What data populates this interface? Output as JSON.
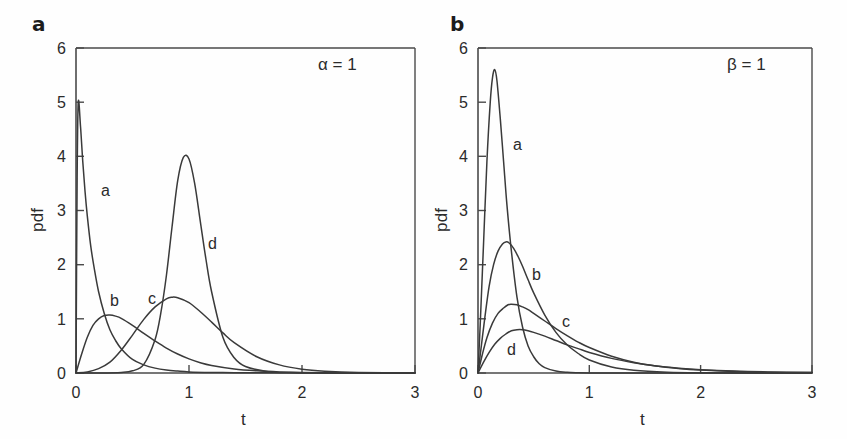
{
  "figure": {
    "background": "#ffffff",
    "line_color": "#3a3a3a",
    "axis_color": "#4a4a4a",
    "text_color": "#2b2b2b"
  },
  "panels": [
    {
      "id": "a",
      "label": "a",
      "annotation": "α = 1",
      "xlabel": "t",
      "ylabel": "pdf",
      "xticks": [
        "0",
        "1",
        "2",
        "3"
      ],
      "yticks": [
        "0",
        "1",
        "2",
        "3",
        "4",
        "5",
        "6"
      ],
      "curve_labels": [
        "a",
        "b",
        "c",
        "d"
      ]
    },
    {
      "id": "b",
      "label": "b",
      "annotation": "β = 1",
      "xlabel": "t",
      "ylabel": "pdf",
      "xticks": [
        "0",
        "1",
        "2",
        "3"
      ],
      "yticks": [
        "0",
        "1",
        "2",
        "3",
        "4",
        "5",
        "6"
      ],
      "curve_labels": [
        "a",
        "b",
        "c",
        "d"
      ]
    }
  ],
  "chart_data": [
    {
      "type": "line",
      "panel": "a",
      "title": "",
      "annotation": "α = 1",
      "xlabel": "t",
      "ylabel": "pdf",
      "xlim": [
        0,
        3
      ],
      "ylim": [
        0,
        6
      ],
      "xticks": [
        0,
        1,
        2,
        3
      ],
      "yticks": [
        0,
        1,
        2,
        3,
        4,
        5,
        6
      ],
      "grid": false,
      "legend": "inline-curve-labels",
      "series": [
        {
          "name": "a",
          "label_position": {
            "t": 0.27,
            "pdf": 3.45
          },
          "peak": {
            "t": 0.02,
            "pdf": 5.0
          },
          "x": [
            0.0,
            0.01,
            0.02,
            0.04,
            0.06,
            0.08,
            0.1,
            0.13,
            0.16,
            0.2,
            0.25,
            0.3,
            0.35,
            0.4,
            0.5,
            0.6,
            0.7,
            0.8,
            0.9,
            1.0,
            1.2,
            1.4,
            1.6,
            1.8,
            2.0,
            2.4,
            3.0
          ],
          "y": [
            0.0,
            3.6,
            5.0,
            4.55,
            3.9,
            3.35,
            2.9,
            2.35,
            1.95,
            1.5,
            1.1,
            0.8,
            0.6,
            0.45,
            0.25,
            0.15,
            0.09,
            0.055,
            0.035,
            0.02,
            0.01,
            0.006,
            0.004,
            0.003,
            0.002,
            0.001,
            0.0
          ]
        },
        {
          "name": "b",
          "label_position": {
            "t": 0.34,
            "pdf": 1.33
          },
          "peak": {
            "t": 0.32,
            "pdf": 1.07
          },
          "x": [
            0.0,
            0.05,
            0.1,
            0.15,
            0.2,
            0.25,
            0.3,
            0.35,
            0.4,
            0.5,
            0.6,
            0.7,
            0.8,
            0.9,
            1.0,
            1.1,
            1.2,
            1.4,
            1.6,
            1.8,
            2.0,
            2.3,
            2.6,
            3.0
          ],
          "y": [
            0.0,
            0.35,
            0.66,
            0.88,
            1.0,
            1.06,
            1.07,
            1.05,
            1.01,
            0.88,
            0.73,
            0.59,
            0.46,
            0.35,
            0.26,
            0.19,
            0.14,
            0.075,
            0.04,
            0.02,
            0.011,
            0.004,
            0.002,
            0.001
          ]
        },
        {
          "name": "c",
          "label_position": {
            "t": 0.69,
            "pdf": 1.38
          },
          "peak": {
            "t": 0.85,
            "pdf": 1.4
          },
          "x": [
            0.0,
            0.1,
            0.2,
            0.3,
            0.4,
            0.5,
            0.6,
            0.7,
            0.8,
            0.85,
            0.9,
            1.0,
            1.1,
            1.2,
            1.3,
            1.4,
            1.6,
            1.8,
            2.0,
            2.2,
            2.5,
            3.0
          ],
          "y": [
            0.0,
            0.02,
            0.08,
            0.2,
            0.42,
            0.7,
            0.99,
            1.22,
            1.37,
            1.4,
            1.39,
            1.3,
            1.13,
            0.94,
            0.74,
            0.56,
            0.3,
            0.15,
            0.07,
            0.033,
            0.01,
            0.002
          ]
        },
        {
          "name": "d",
          "label_position": {
            "t": 1.23,
            "pdf": 2.42
          },
          "peak": {
            "t": 0.96,
            "pdf": 4.0
          },
          "x": [
            0.0,
            0.2,
            0.4,
            0.5,
            0.6,
            0.7,
            0.75,
            0.8,
            0.85,
            0.9,
            0.95,
            1.0,
            1.05,
            1.1,
            1.15,
            1.2,
            1.3,
            1.4,
            1.5,
            1.7,
            1.9,
            2.2,
            2.6,
            3.0
          ],
          "y": [
            0.0,
            0.0,
            0.01,
            0.04,
            0.16,
            0.62,
            1.1,
            1.8,
            2.7,
            3.55,
            3.98,
            3.95,
            3.5,
            2.8,
            2.1,
            1.5,
            0.66,
            0.28,
            0.12,
            0.025,
            0.007,
            0.002,
            0.0,
            0.0
          ]
        }
      ]
    },
    {
      "type": "line",
      "panel": "b",
      "title": "",
      "annotation": "β = 1",
      "xlabel": "t",
      "ylabel": "pdf",
      "xlim": [
        0,
        3
      ],
      "ylim": [
        0,
        6
      ],
      "xticks": [
        0,
        1,
        2,
        3
      ],
      "yticks": [
        0,
        1,
        2,
        3,
        4,
        5,
        6
      ],
      "grid": false,
      "legend": "inline-curve-labels",
      "series": [
        {
          "name": "a",
          "label_position": {
            "t": 0.34,
            "pdf": 4.28
          },
          "peak": {
            "t": 0.15,
            "pdf": 5.6
          },
          "x": [
            0.0,
            0.02,
            0.05,
            0.08,
            0.11,
            0.13,
            0.15,
            0.17,
            0.2,
            0.23,
            0.26,
            0.3,
            0.35,
            0.4,
            0.45,
            0.5,
            0.55,
            0.6,
            0.7,
            0.8,
            0.9,
            1.0,
            1.2,
            1.5,
            2.0,
            3.0
          ],
          "y": [
            0.0,
            0.9,
            2.4,
            3.9,
            5.0,
            5.45,
            5.6,
            5.4,
            4.7,
            3.9,
            3.1,
            2.25,
            1.4,
            0.85,
            0.5,
            0.3,
            0.17,
            0.1,
            0.035,
            0.012,
            0.005,
            0.002,
            0.0,
            0.0,
            0.0,
            0.0
          ]
        },
        {
          "name": "b",
          "label_position": {
            "t": 0.5,
            "pdf": 1.93
          },
          "peak": {
            "t": 0.25,
            "pdf": 2.42
          },
          "x": [
            0.0,
            0.03,
            0.06,
            0.1,
            0.14,
            0.18,
            0.22,
            0.25,
            0.28,
            0.32,
            0.36,
            0.4,
            0.45,
            0.5,
            0.6,
            0.7,
            0.8,
            0.9,
            1.0,
            1.2,
            1.4,
            1.7,
            2.0,
            2.5,
            3.0
          ],
          "y": [
            0.0,
            0.5,
            1.0,
            1.6,
            2.0,
            2.25,
            2.38,
            2.42,
            2.4,
            2.3,
            2.15,
            1.97,
            1.72,
            1.48,
            1.07,
            0.75,
            0.52,
            0.36,
            0.24,
            0.11,
            0.05,
            0.016,
            0.005,
            0.001,
            0.0
          ]
        },
        {
          "name": "c",
          "label_position": {
            "t": 0.77,
            "pdf": 0.97
          },
          "peak": {
            "t": 0.3,
            "pdf": 1.27
          },
          "x": [
            0.0,
            0.04,
            0.08,
            0.13,
            0.18,
            0.23,
            0.27,
            0.3,
            0.35,
            0.4,
            0.45,
            0.5,
            0.6,
            0.7,
            0.8,
            0.9,
            1.0,
            1.2,
            1.4,
            1.6,
            1.8,
            2.0,
            2.3,
            2.6,
            3.0
          ],
          "y": [
            0.0,
            0.35,
            0.65,
            0.92,
            1.1,
            1.2,
            1.26,
            1.27,
            1.26,
            1.22,
            1.17,
            1.1,
            0.96,
            0.82,
            0.69,
            0.57,
            0.47,
            0.31,
            0.2,
            0.13,
            0.085,
            0.055,
            0.028,
            0.015,
            0.007
          ]
        },
        {
          "name": "d",
          "label_position": {
            "t": 0.22,
            "pdf": 0.45
          },
          "peak": {
            "t": 0.35,
            "pdf": 0.8
          },
          "x": [
            0.0,
            0.05,
            0.1,
            0.15,
            0.2,
            0.25,
            0.3,
            0.35,
            0.4,
            0.45,
            0.5,
            0.6,
            0.7,
            0.8,
            0.9,
            1.0,
            1.2,
            1.4,
            1.6,
            1.8,
            2.0,
            2.3,
            2.6,
            3.0
          ],
          "y": [
            0.0,
            0.2,
            0.38,
            0.53,
            0.64,
            0.72,
            0.78,
            0.8,
            0.8,
            0.78,
            0.75,
            0.68,
            0.6,
            0.52,
            0.45,
            0.38,
            0.27,
            0.19,
            0.13,
            0.09,
            0.062,
            0.035,
            0.02,
            0.01
          ]
        }
      ]
    }
  ]
}
